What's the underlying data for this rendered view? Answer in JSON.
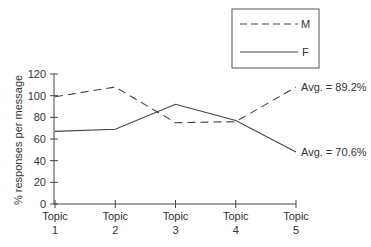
{
  "chart_data": {
    "type": "line",
    "title": "",
    "xlabel": "",
    "ylabel": "% responses per message",
    "categories": [
      "Topic 1",
      "Topic 2",
      "Topic 3",
      "Topic 4",
      "Topic 5"
    ],
    "x_tick_labels": [
      {
        "line1": "Topic",
        "line2": "1"
      },
      {
        "line1": "Topic",
        "line2": "2"
      },
      {
        "line1": "Topic",
        "line2": "3"
      },
      {
        "line1": "Topic",
        "line2": "4"
      },
      {
        "line1": "Topic",
        "line2": "5"
      }
    ],
    "y_ticks": [
      0,
      20,
      40,
      60,
      80,
      100,
      120
    ],
    "ylim": [
      0,
      120
    ],
    "grid": false,
    "legend_position": "top-right",
    "series": [
      {
        "name": "M",
        "style": "dashed",
        "values": [
          99,
          108,
          75,
          76,
          108
        ],
        "annotation": "Avg. = 89.2%"
      },
      {
        "name": "F",
        "style": "solid",
        "values": [
          67,
          69,
          92,
          77,
          48
        ],
        "annotation": "Avg. = 70.6%"
      }
    ],
    "line_color": "#444444"
  }
}
